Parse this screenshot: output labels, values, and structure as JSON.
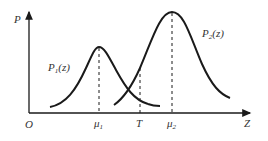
{
  "axes": {
    "y_label": "P",
    "x_label": "Z",
    "origin_label": "O"
  },
  "curves": [
    {
      "name": "P1(z)",
      "label_main": "P",
      "label_sub": "1",
      "label_arg": "(z)",
      "mean_label_main": "μ",
      "mean_label_sub": "1"
    },
    {
      "name": "P2(z)",
      "label_main": "P",
      "label_sub": "2",
      "label_arg": "(z)",
      "mean_label_main": "μ",
      "mean_label_sub": "2"
    }
  ],
  "threshold": {
    "label": "T"
  },
  "colors": {
    "line": "#1a1a1a",
    "text": "#333333"
  }
}
